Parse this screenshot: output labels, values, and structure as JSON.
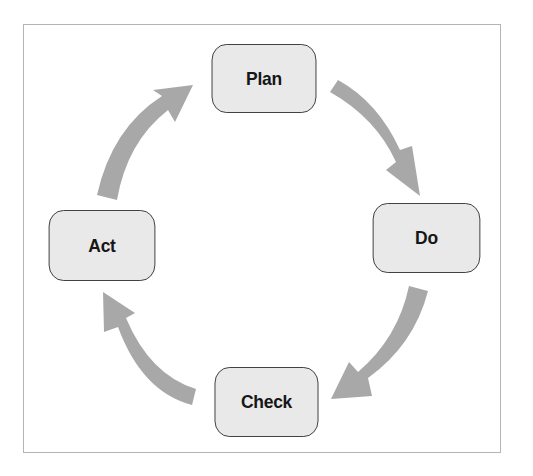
{
  "diagram": {
    "type": "cycle",
    "title": "",
    "nodes": [
      {
        "id": "plan",
        "label": "Plan"
      },
      {
        "id": "do",
        "label": "Do"
      },
      {
        "id": "check",
        "label": "Check"
      },
      {
        "id": "act",
        "label": "Act"
      }
    ],
    "edges": [
      {
        "from": "plan",
        "to": "do"
      },
      {
        "from": "do",
        "to": "check"
      },
      {
        "from": "check",
        "to": "act"
      },
      {
        "from": "act",
        "to": "plan"
      }
    ],
    "colors": {
      "node_fill": "#e9e9e9",
      "node_border": "#3a3a3a",
      "arrow": "#a8a8a8",
      "frame_border": "#b4b4b4",
      "text": "#161616"
    }
  }
}
